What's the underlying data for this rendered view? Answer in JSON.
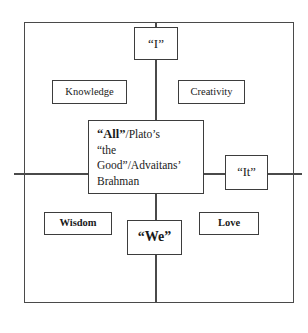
{
  "diagram": {
    "frame": {
      "label": "outer-boundary"
    },
    "axes": {
      "vertical_label": "vertical-axis",
      "horizontal_label": "horizontal-axis"
    },
    "nodes": {
      "top": {
        "id": "i",
        "label": "“I”"
      },
      "upper_left": {
        "id": "knowledge",
        "label": "Knowledge"
      },
      "upper_right": {
        "id": "creativity",
        "label": "Creativity"
      },
      "center": {
        "id": "all",
        "line1_strong": "“All”",
        "line1_rest": "/Plato’s",
        "line2": "“the",
        "line3": "Good”/Advaitans’",
        "line4": "Brahman",
        "full_text": "“All”/Plato’s “the Good”/Advaitans’ Brahman"
      },
      "right": {
        "id": "it",
        "label": "“It”"
      },
      "lower_left": {
        "id": "wisdom",
        "label": "Wisdom"
      },
      "lower_right": {
        "id": "love",
        "label": "Love"
      },
      "bottom": {
        "id": "we",
        "label": "“We”"
      }
    },
    "colors": {
      "line": "#4a4a4a",
      "box_border": "#3d3d3d",
      "text": "#1a1a1a",
      "background": "#ffffff"
    }
  }
}
